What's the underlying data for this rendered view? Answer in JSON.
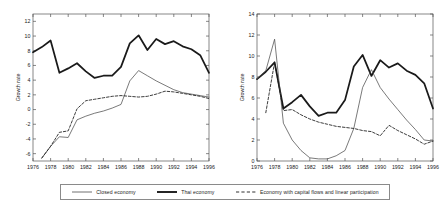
{
  "figure": {
    "background_color": "#ffffff",
    "panels": [
      "left",
      "right"
    ]
  },
  "legend": {
    "position": "bottom-center",
    "entries": [
      {
        "label": "Closed economy",
        "style": "solid-thin",
        "color": "#4d4d4d",
        "icon": "line-solid-thin-icon"
      },
      {
        "label": "Thai economy",
        "style": "solid-thick",
        "color": "#1a1a1a",
        "icon": "line-solid-thick-icon"
      },
      {
        "label": "Economy with capital flows and linear participation",
        "style": "dashed",
        "color": "#1a1a1a",
        "icon": "line-dashed-icon"
      }
    ]
  },
  "chart_data": [
    {
      "id": "left-panel",
      "type": "line",
      "title": "",
      "xlabel": "",
      "ylabel": "Growth rate",
      "xlim": [
        1976,
        1996
      ],
      "ylim": [
        -7,
        13
      ],
      "yticks": [
        -6,
        -4,
        -2,
        0,
        2,
        4,
        6,
        8,
        10,
        12
      ],
      "xticks": [
        1976,
        1978,
        1980,
        1982,
        1984,
        1986,
        1988,
        1990,
        1992,
        1994,
        1996
      ],
      "grid": false,
      "legend_position": "bottom",
      "x": [
        1976,
        1977,
        1978,
        1979,
        1980,
        1981,
        1982,
        1983,
        1984,
        1985,
        1986,
        1987,
        1988,
        1989,
        1990,
        1991,
        1992,
        1993,
        1994,
        1995,
        1996
      ],
      "series": [
        {
          "name": "Thai economy",
          "style": "solid-thick",
          "color": "#1a1a1a",
          "values": [
            7.8,
            8.5,
            9.4,
            5.0,
            5.6,
            6.3,
            5.2,
            4.3,
            4.6,
            4.6,
            5.8,
            9.0,
            10.1,
            8.1,
            9.6,
            8.9,
            9.3,
            8.6,
            8.2,
            7.4,
            5.0
          ]
        },
        {
          "name": "Closed economy",
          "style": "solid-thin",
          "color": "#4d4d4d",
          "values": [
            null,
            -6.6,
            -5.0,
            -3.7,
            -3.8,
            -1.4,
            -0.9,
            -0.5,
            -0.2,
            0.2,
            0.7,
            3.9,
            5.3,
            4.6,
            3.9,
            3.3,
            2.7,
            2.3,
            2.1,
            1.9,
            1.7
          ]
        },
        {
          "name": "Economy with capital flows and linear participation",
          "style": "dashed",
          "color": "#1a1a1a",
          "values": [
            null,
            -6.6,
            -5.0,
            -3.1,
            -2.9,
            0.1,
            1.2,
            1.4,
            1.6,
            1.8,
            1.9,
            1.8,
            1.7,
            1.8,
            2.1,
            2.5,
            2.4,
            2.2,
            2.0,
            1.8,
            1.5
          ]
        }
      ]
    },
    {
      "id": "right-panel",
      "type": "line",
      "title": "",
      "xlabel": "",
      "ylabel": "Growth rate",
      "xlim": [
        1976,
        1996
      ],
      "ylim": [
        0,
        14
      ],
      "yticks": [
        0,
        2,
        4,
        6,
        8,
        10,
        12,
        14
      ],
      "xticks": [
        1976,
        1978,
        1980,
        1982,
        1984,
        1986,
        1988,
        1990,
        1992,
        1994,
        1996
      ],
      "grid": false,
      "legend_position": "bottom",
      "x": [
        1976,
        1977,
        1978,
        1979,
        1980,
        1981,
        1982,
        1983,
        1984,
        1985,
        1986,
        1987,
        1988,
        1989,
        1990,
        1991,
        1992,
        1993,
        1994,
        1995,
        1996
      ],
      "series": [
        {
          "name": "Thai economy",
          "style": "solid-thick",
          "color": "#1a1a1a",
          "values": [
            7.8,
            8.5,
            9.4,
            5.0,
            5.6,
            6.3,
            5.2,
            4.3,
            4.6,
            4.6,
            5.8,
            9.0,
            10.1,
            8.1,
            9.6,
            8.9,
            9.3,
            8.6,
            8.2,
            7.4,
            5.0
          ]
        },
        {
          "name": "Closed economy",
          "style": "solid-thin",
          "color": "#4d4d4d",
          "values": [
            7.8,
            8.6,
            11.6,
            3.6,
            2.0,
            1.0,
            0.3,
            0.2,
            0.2,
            0.5,
            1.0,
            3.1,
            7.0,
            8.7,
            7.0,
            5.9,
            4.9,
            3.9,
            3.0,
            2.0,
            1.9
          ]
        },
        {
          "name": "Economy with capital flows and linear participation",
          "style": "dashed",
          "color": "#1a1a1a",
          "values": [
            null,
            4.6,
            9.4,
            4.8,
            4.9,
            4.4,
            4.0,
            3.7,
            3.5,
            3.3,
            3.2,
            3.1,
            2.9,
            2.8,
            2.4,
            3.4,
            2.9,
            2.5,
            2.1,
            1.6,
            1.9
          ]
        }
      ]
    }
  ]
}
